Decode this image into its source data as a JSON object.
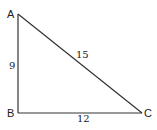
{
  "diagram": {
    "vertices": [
      {
        "name": "A",
        "x": 18,
        "y": 14
      },
      {
        "name": "B",
        "x": 18,
        "y": 113
      },
      {
        "name": "C",
        "x": 142,
        "y": 113
      }
    ],
    "sides": [
      {
        "from": "A",
        "to": "B",
        "length_label": "9"
      },
      {
        "from": "A",
        "to": "C",
        "length_label": "15"
      },
      {
        "from": "B",
        "to": "C",
        "length_label": "12"
      }
    ],
    "labels": {
      "A": "A",
      "B": "B",
      "C": "C",
      "AB": "9",
      "AC": "15",
      "BC": "12"
    },
    "line_color": "#333333"
  }
}
